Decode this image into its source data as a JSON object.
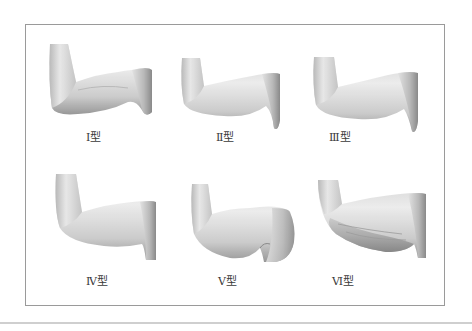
{
  "figure": {
    "title": "",
    "types": [
      {
        "id": "I",
        "label": "Ⅰ型"
      },
      {
        "id": "II",
        "label": "Ⅱ型"
      },
      {
        "id": "III",
        "label": "Ⅲ型"
      },
      {
        "id": "IV",
        "label": "Ⅳ型"
      },
      {
        "id": "V",
        "label": "Ⅴ型"
      },
      {
        "id": "VI",
        "label": "Ⅵ型"
      }
    ]
  },
  "colors": {
    "frame_border": "#9a9a9a",
    "label_text": "#3a3a3a",
    "skin_light": "#eeeeee",
    "skin_mid": "#c4c4c4",
    "skin_dark": "#7a7a7a"
  }
}
